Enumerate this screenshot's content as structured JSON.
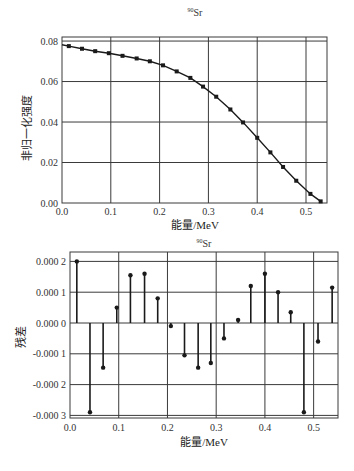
{
  "chart_data": [
    {
      "type": "line",
      "title": "90Sr",
      "title_superscript": "90",
      "title_element": "Sr",
      "xlabel": "能量/MeV",
      "ylabel": "非归一化强度",
      "xlim": [
        0.0,
        0.543
      ],
      "ylim": [
        0.0,
        0.082
      ],
      "xticks": [
        "0.0",
        "0.1",
        "0.2",
        "0.3",
        "0.4",
        "0.5"
      ],
      "yticks": [
        "0.00",
        "0.02",
        "0.04",
        "0.06",
        "0.08"
      ],
      "grid": true,
      "legend": null,
      "series": [
        {
          "name": "fit",
          "style": "line-with-markers",
          "x": [
            0.0,
            0.014,
            0.041,
            0.068,
            0.096,
            0.124,
            0.153,
            0.18,
            0.207,
            0.235,
            0.263,
            0.289,
            0.316,
            0.345,
            0.371,
            0.4,
            0.427,
            0.453,
            0.48,
            0.509,
            0.53
          ],
          "y": [
            0.0782,
            0.0775,
            0.0762,
            0.075,
            0.074,
            0.0727,
            0.0714,
            0.07,
            0.068,
            0.065,
            0.0618,
            0.0575,
            0.0525,
            0.0462,
            0.0398,
            0.0322,
            0.025,
            0.0178,
            0.011,
            0.0045,
            0.0008
          ]
        }
      ]
    },
    {
      "type": "stem",
      "title": "90Sr",
      "title_superscript": "90",
      "title_element": "Sr",
      "xlabel": "能量/MeV",
      "ylabel": "残差",
      "xlim": [
        0.0,
        0.55
      ],
      "ylim": [
        -0.00031,
        0.00023
      ],
      "xticks": [
        "0.0",
        "0.1",
        "0.2",
        "0.3",
        "0.4",
        "0.5"
      ],
      "yticks": [
        "0.000 2",
        "0.000 1",
        "0.000 0",
        "-0.000 1",
        "-0.000 2",
        "-0.000 3"
      ],
      "grid": true,
      "legend": null,
      "series": [
        {
          "name": "residual",
          "x": [
            0.014,
            0.041,
            0.068,
            0.096,
            0.124,
            0.153,
            0.18,
            0.207,
            0.235,
            0.263,
            0.289,
            0.316,
            0.345,
            0.371,
            0.4,
            0.427,
            0.453,
            0.48,
            0.509,
            0.538
          ],
          "y": [
            0.0002,
            -0.00029,
            -0.000145,
            5e-05,
            0.000155,
            0.00016,
            8e-05,
            -1e-05,
            -0.000105,
            -0.000145,
            -0.00013,
            -5e-05,
            1e-05,
            0.00012,
            0.00016,
            0.0001,
            3.5e-05,
            -0.00029,
            -6e-05,
            0.000115
          ]
        }
      ]
    }
  ],
  "colors": {
    "line": "#1a1a1a",
    "grid": "#3a3a3a",
    "frame": "#3a3a3a",
    "text": "#222222"
  }
}
